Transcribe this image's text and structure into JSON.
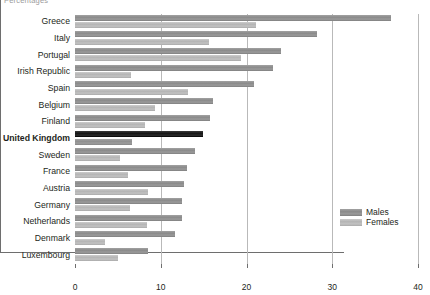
{
  "caption": "Percentages",
  "legend": {
    "position": "inside-right",
    "entries": [
      {
        "label": "Males",
        "color": "#8a8a8a"
      },
      {
        "label": "Females",
        "color": "#b4b4b4"
      }
    ]
  },
  "highlighted_category": "United Kingdom",
  "axis": {
    "x_ticks": [
      "0",
      "10",
      "20",
      "30",
      "40"
    ]
  },
  "chart_data": {
    "type": "bar",
    "orientation": "horizontal",
    "title": "",
    "subtitle": "",
    "xlabel": "Percentages",
    "ylabel": "",
    "xlim": [
      0,
      40
    ],
    "xticks": [
      0,
      10,
      20,
      30,
      40
    ],
    "grid": true,
    "grid_axis": "x",
    "legend_position": "inside-right",
    "highlight": "United Kingdom",
    "categories": [
      "Greece",
      "Italy",
      "Portugal",
      "Irish Republic",
      "Spain",
      "Belgium",
      "Finland",
      "United Kingdom",
      "Sweden",
      "France",
      "Austria",
      "Germany",
      "Netherlands",
      "Denmark",
      "Luxembourg"
    ],
    "series": [
      {
        "name": "Males",
        "color": "#8a8a8a",
        "values": [
          36.8,
          28.2,
          24.0,
          23.1,
          20.9,
          16.1,
          15.7,
          14.9,
          14.0,
          13.1,
          12.7,
          12.5,
          12.5,
          11.7,
          8.5
        ]
      },
      {
        "name": "Females",
        "color": "#b4b4b4",
        "values": [
          21.1,
          15.6,
          19.4,
          6.5,
          13.2,
          9.3,
          8.2,
          6.7,
          5.2,
          6.2,
          8.5,
          6.4,
          8.4,
          3.5,
          5.0
        ]
      }
    ]
  }
}
